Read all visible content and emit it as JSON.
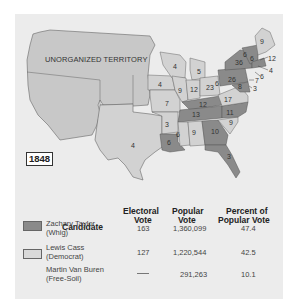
{
  "map": {
    "year": "1848",
    "territory_label": "UNORGANIZED TERRITORY",
    "colors": {
      "whig": "#8a8a8a",
      "democrat": "#d2d2d2",
      "territory": "#c8c8c8",
      "background": "#ececec"
    },
    "state_labels": [
      {
        "value": "4",
        "x": 133,
        "y": 145,
        "party": "democrat"
      },
      {
        "value": "4",
        "x": 175,
        "y": 66,
        "party": "democrat"
      },
      {
        "value": "4",
        "x": 160,
        "y": 84,
        "party": "democrat"
      },
      {
        "value": "5",
        "x": 199,
        "y": 71,
        "party": "democrat"
      },
      {
        "value": "6",
        "x": 217,
        "y": 83,
        "party": "whig"
      },
      {
        "value": "9",
        "x": 180,
        "y": 90,
        "party": "democrat"
      },
      {
        "value": "12",
        "x": 194,
        "y": 89,
        "party": "democrat"
      },
      {
        "value": "23",
        "x": 210,
        "y": 87,
        "party": "democrat"
      },
      {
        "value": "7",
        "x": 167,
        "y": 103,
        "party": "democrat"
      },
      {
        "value": "12",
        "x": 203,
        "y": 104,
        "party": "whig"
      },
      {
        "value": "17",
        "x": 228,
        "y": 99,
        "party": "democrat"
      },
      {
        "value": "26",
        "x": 232,
        "y": 79,
        "party": "whig"
      },
      {
        "value": "36",
        "x": 239,
        "y": 62,
        "party": "whig"
      },
      {
        "value": "6",
        "x": 245,
        "y": 54,
        "party": "whig"
      },
      {
        "value": "6",
        "x": 252,
        "y": 58,
        "party": "whig"
      },
      {
        "value": "9",
        "x": 262,
        "y": 41,
        "party": "democrat"
      },
      {
        "value": "12",
        "x": 272,
        "y": 58,
        "party": "whig"
      },
      {
        "value": "4",
        "x": 271,
        "y": 70,
        "party": "whig"
      },
      {
        "value": "6",
        "x": 262,
        "y": 76,
        "party": "whig"
      },
      {
        "value": "7",
        "x": 257,
        "y": 80,
        "party": "whig"
      },
      {
        "value": "8",
        "x": 240,
        "y": 86,
        "party": "whig"
      },
      {
        "value": "3",
        "x": 255,
        "y": 88,
        "party": "whig"
      },
      {
        "value": "3",
        "x": 167,
        "y": 124,
        "party": "democrat"
      },
      {
        "value": "13",
        "x": 196,
        "y": 114,
        "party": "whig"
      },
      {
        "value": "11",
        "x": 230,
        "y": 112,
        "party": "whig"
      },
      {
        "value": "9",
        "x": 231,
        "y": 122,
        "party": "democrat"
      },
      {
        "value": "6",
        "x": 178,
        "y": 134,
        "party": "democrat"
      },
      {
        "value": "9",
        "x": 194,
        "y": 132,
        "party": "democrat"
      },
      {
        "value": "10",
        "x": 215,
        "y": 131,
        "party": "whig"
      },
      {
        "value": "6",
        "x": 169,
        "y": 142,
        "party": "whig"
      },
      {
        "value": "3",
        "x": 229,
        "y": 156,
        "party": "whig"
      }
    ]
  },
  "table": {
    "headers": {
      "candidate": "Candidate",
      "electoral_line1": "Electoral",
      "electoral_line2": "Vote",
      "popular_line1": "Popular",
      "popular_line2": "Vote",
      "percent_line1": "Percent of",
      "percent_line2": "Popular Vote"
    },
    "rows": [
      {
        "name": "Zachary Taylor",
        "party": "(Whig)",
        "electoral": "163",
        "popular": "1,360,099",
        "percent": "47.4",
        "swatch": "#8a8a8a"
      },
      {
        "name": "Lewis Cass",
        "party": "(Democrat)",
        "electoral": "127",
        "popular": "1,220,544",
        "percent": "42.5",
        "swatch": "#d9d9d9"
      },
      {
        "name": "Martin Van Buren",
        "party": "(Free-Soil)",
        "electoral": "—",
        "popular": "291,263",
        "percent": "10.1",
        "swatch": null
      }
    ]
  }
}
